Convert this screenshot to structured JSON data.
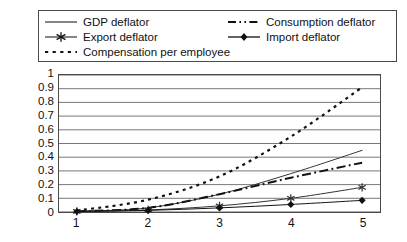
{
  "chart_data": {
    "type": "line",
    "title": "",
    "subtitle": "",
    "xlabel": "",
    "ylabel": "",
    "x": [
      1,
      2,
      3,
      4,
      5
    ],
    "xticklabels": [
      "1",
      "2",
      "3",
      "4",
      "5"
    ],
    "yticklabels": [
      "0",
      "0.1",
      "0.2",
      "0.3",
      "0.4",
      "0.5",
      "0.6",
      "0.7",
      "0.8",
      "0.9",
      "1"
    ],
    "ylim": [
      0,
      1
    ],
    "xlim": [
      1,
      5
    ],
    "ytick_step": 0.1,
    "grid": "horizontal",
    "legend_position": "top",
    "series": [
      {
        "name": "GDP deflator",
        "style": "solid",
        "marker": "none",
        "color": "#333333",
        "values": [
          0.005,
          0.03,
          0.13,
          0.28,
          0.45
        ]
      },
      {
        "name": "Consumption deflator",
        "style": "dash-dot",
        "marker": "none",
        "color": "#111111",
        "values": [
          0.005,
          0.03,
          0.13,
          0.25,
          0.36
        ]
      },
      {
        "name": "Export deflator",
        "style": "solid",
        "marker": "star",
        "color": "#333333",
        "values": [
          0.004,
          0.015,
          0.045,
          0.1,
          0.18
        ]
      },
      {
        "name": "Import deflator",
        "style": "solid",
        "marker": "diamond",
        "color": "#111111",
        "values": [
          0.004,
          0.012,
          0.03,
          0.055,
          0.085
        ]
      },
      {
        "name": "Compensation per employee",
        "style": "dotted",
        "marker": "none",
        "color": "#111111",
        "values": [
          0.01,
          0.09,
          0.26,
          0.55,
          0.91
        ]
      }
    ]
  },
  "legend": {
    "entries": [
      {
        "label": "GDP deflator",
        "style": "solid",
        "marker": "none"
      },
      {
        "label": "Export deflator",
        "style": "solid",
        "marker": "star"
      },
      {
        "label": "Compensation per employee",
        "style": "dotted",
        "marker": "none"
      },
      {
        "label": "Consumption deflator",
        "style": "dash-dot",
        "marker": "none"
      },
      {
        "label": "Import deflator",
        "style": "solid",
        "marker": "diamond"
      }
    ]
  },
  "colors": {
    "frame": "#4a4a4a",
    "gridline": "#555555",
    "line": "#222222",
    "background": "#ffffff",
    "text": "#111111"
  }
}
